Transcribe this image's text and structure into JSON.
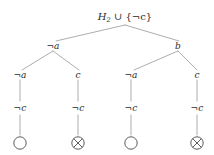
{
  "figure": {
    "kind": "semantic-tableau-tree",
    "background_color": "#ffffff",
    "line_color": "#8a8a8a",
    "text_color": "#2b2b2b"
  },
  "root": {
    "prefix": "H",
    "subscript": "2",
    "operator": " ∪ ",
    "set": "{¬c}",
    "full_text": "H₂ ∪ {¬c}"
  },
  "level1": {
    "nodes": [
      {
        "label": "¬a"
      },
      {
        "label": "b"
      }
    ]
  },
  "level2": {
    "nodes": [
      {
        "label": "¬a"
      },
      {
        "label": "c"
      },
      {
        "label": "¬a"
      },
      {
        "label": "c"
      }
    ]
  },
  "level3": {
    "nodes": [
      {
        "label": "¬c"
      },
      {
        "label": "¬c"
      },
      {
        "label": "¬c"
      },
      {
        "label": "¬c"
      }
    ]
  },
  "leaves": {
    "nodes": [
      {
        "kind": "open-branch",
        "glyph": "○"
      },
      {
        "kind": "closed-branch",
        "glyph": "⊗"
      },
      {
        "kind": "open-branch",
        "glyph": "○"
      },
      {
        "kind": "closed-branch",
        "glyph": "⊗"
      }
    ]
  }
}
